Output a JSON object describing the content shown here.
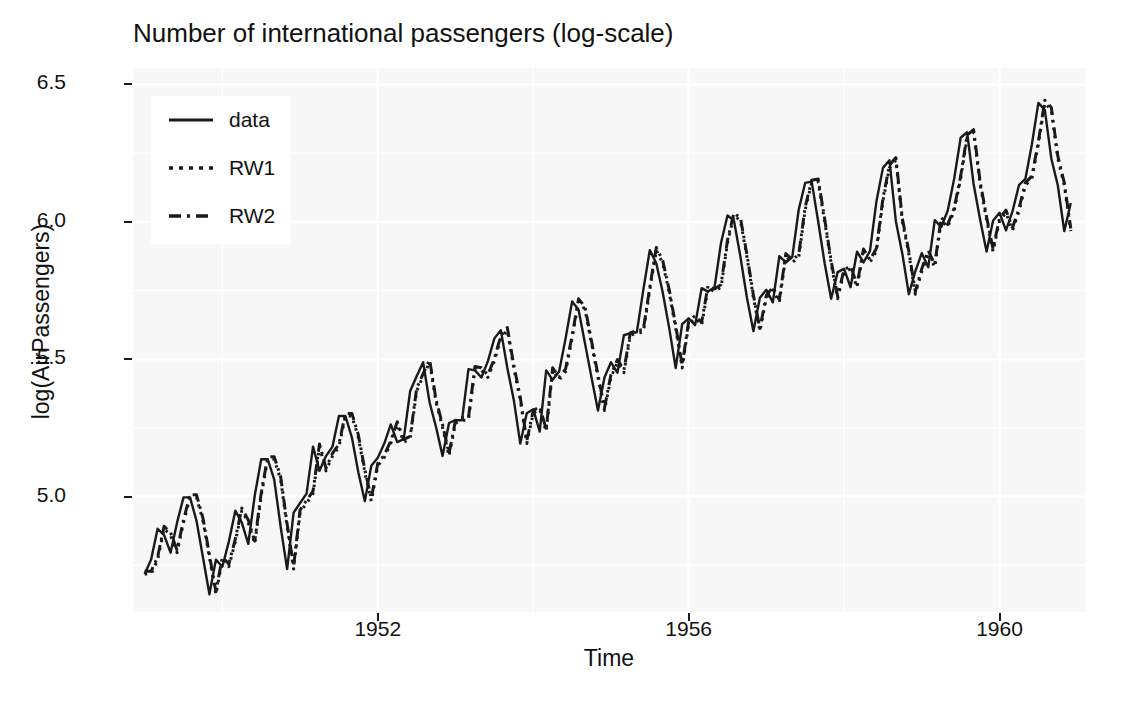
{
  "chart_data": {
    "type": "line",
    "title": "Number of international passengers (log-scale)",
    "xlabel": "Time",
    "ylabel": "log(AirPassengers)",
    "xlim": [
      1948.85,
      1961.1
    ],
    "ylim": [
      4.58,
      6.56
    ],
    "xticks": [
      1952,
      1956,
      1960
    ],
    "xtick_labels": [
      "1952",
      "1956",
      "1960"
    ],
    "yticks": [
      5.0,
      5.5,
      6.0,
      6.5
    ],
    "ytick_labels": [
      "5.0",
      "5.5",
      "6.0",
      "6.5"
    ],
    "grid": true,
    "grid_major_x": [
      1952,
      1956,
      1960
    ],
    "grid_major_y": [
      5.0,
      5.5,
      6.0,
      6.5
    ],
    "grid_minor_x": [
      1950,
      1954,
      1958
    ],
    "grid_minor_y": [
      4.75,
      5.25,
      5.75,
      6.25
    ],
    "legend_position": "top-left",
    "legend_entries": [
      {
        "label": "data",
        "style": "solid"
      },
      {
        "label": "RW1",
        "style": "dotted"
      },
      {
        "label": "RW2",
        "style": "dashed"
      }
    ],
    "x_start": 1949.0,
    "x_step": 0.0833333,
    "series": [
      {
        "name": "data",
        "style": "solid",
        "values": [
          4.718499,
          4.770685,
          4.882802,
          4.859812,
          4.795791,
          4.905275,
          4.997212,
          4.997212,
          4.912655,
          4.779123,
          4.644391,
          4.770685,
          4.744932,
          4.836282,
          4.94876,
          4.905275,
          4.828314,
          5.003946,
          5.135798,
          5.135798,
          5.062595,
          4.890349,
          4.736198,
          4.941642,
          4.976734,
          5.010635,
          5.181784,
          5.09375,
          5.147494,
          5.181784,
          5.293305,
          5.293305,
          5.214936,
          5.087596,
          4.983607,
          5.111988,
          5.141664,
          5.192957,
          5.26269,
          5.198497,
          5.209486,
          5.384495,
          5.438079,
          5.488938,
          5.342334,
          5.252273,
          5.147494,
          5.267858,
          5.278115,
          5.278115,
          5.463832,
          5.459586,
          5.433722,
          5.493061,
          5.575949,
          5.605802,
          5.46806,
          5.351858,
          5.192957,
          5.303305,
          5.31812,
          5.236442,
          5.459586,
          5.42495,
          5.455321,
          5.575949,
          5.710427,
          5.680173,
          5.556828,
          5.433722,
          5.313206,
          5.433722,
          5.488938,
          5.451038,
          5.587249,
          5.594711,
          5.598422,
          5.752573,
          5.897154,
          5.849325,
          5.743003,
          5.613128,
          5.46806,
          5.627621,
          5.648974,
          5.624018,
          5.758902,
          5.746203,
          5.762051,
          5.924256,
          6.023448,
          6.003887,
          5.872118,
          5.723585,
          5.602119,
          5.723585,
          5.752573,
          5.70711,
          5.874931,
          5.852202,
          5.872118,
          6.045005,
          6.142037,
          6.146329,
          6.001415,
          5.849325,
          5.720312,
          5.817111,
          5.828946,
          5.762051,
          5.891644,
          5.852202,
          5.894403,
          6.075346,
          6.196444,
          6.224558,
          6.001415,
          5.883322,
          5.736572,
          5.820083,
          5.886104,
          5.834811,
          6.006353,
          5.981414,
          6.040254,
          6.156979,
          6.306275,
          6.326149,
          6.137727,
          6.008813,
          5.891644,
          6.003887,
          6.033086,
          5.968708,
          6.037871,
          6.133398,
          6.156979,
          6.282267,
          6.43294,
          6.40688,
          6.230481,
          6.133398,
          5.966147,
          6.068426
        ]
      },
      {
        "name": "RW1",
        "style": "dotted",
        "description": "one-step-ahead random walk forecast: shifted data by one month",
        "values": [
          4.718499,
          4.718499,
          4.770685,
          4.882802,
          4.859812,
          4.795791,
          4.905275,
          4.997212,
          4.997212,
          4.912655,
          4.779123,
          4.644391,
          4.770685,
          4.744932,
          4.836282,
          4.94876,
          4.905275,
          4.828314,
          5.003946,
          5.135798,
          5.135798,
          5.062595,
          4.890349,
          4.736198,
          4.941642,
          4.976734,
          5.010635,
          5.181784,
          5.09375,
          5.147494,
          5.181784,
          5.293305,
          5.293305,
          5.214936,
          5.087596,
          4.983607,
          5.111988,
          5.141664,
          5.192957,
          5.26269,
          5.198497,
          5.209486,
          5.384495,
          5.438079,
          5.488938,
          5.342334,
          5.252273,
          5.147494,
          5.267858,
          5.278115,
          5.278115,
          5.463832,
          5.459586,
          5.433722,
          5.493061,
          5.575949,
          5.605802,
          5.46806,
          5.351858,
          5.192957,
          5.303305,
          5.31812,
          5.236442,
          5.459586,
          5.42495,
          5.455321,
          5.575949,
          5.710427,
          5.680173,
          5.556828,
          5.433722,
          5.313206,
          5.433722,
          5.488938,
          5.451038,
          5.587249,
          5.594711,
          5.598422,
          5.752573,
          5.897154,
          5.849325,
          5.743003,
          5.613128,
          5.46806,
          5.627621,
          5.648974,
          5.624018,
          5.758902,
          5.746203,
          5.762051,
          5.924256,
          6.023448,
          6.003887,
          5.872118,
          5.723585,
          5.602119,
          5.723585,
          5.752573,
          5.70711,
          5.874931,
          5.852202,
          5.872118,
          6.045005,
          6.142037,
          6.146329,
          6.001415,
          5.849325,
          5.720312,
          5.817111,
          5.828946,
          5.762051,
          5.891644,
          5.852202,
          5.894403,
          6.075346,
          6.196444,
          6.224558,
          6.001415,
          5.883322,
          5.736572,
          5.820083,
          5.886104,
          5.834811,
          6.006353,
          5.981414,
          6.040254,
          6.156979,
          6.306275,
          6.326149,
          6.137727,
          6.008813,
          5.891644,
          6.003887,
          6.033086,
          5.968708,
          6.037871,
          6.133398,
          6.156979,
          6.282267,
          6.43294,
          6.40688,
          6.230481,
          6.133398,
          5.966147
        ]
      },
      {
        "name": "RW2",
        "style": "dashed",
        "description": "random walk with drift forecast: shifted data plus drift term",
        "values": [
          4.728,
          4.728,
          4.780185,
          4.892302,
          4.869312,
          4.805291,
          4.914775,
          5.006712,
          5.006712,
          4.922155,
          4.788623,
          4.653891,
          4.780185,
          4.754432,
          4.845782,
          4.95826,
          4.914775,
          4.837814,
          5.013446,
          5.145298,
          5.145298,
          5.072095,
          4.899849,
          4.745698,
          4.951142,
          4.986234,
          5.020135,
          5.191284,
          5.10325,
          5.156994,
          5.191284,
          5.302805,
          5.302805,
          5.224436,
          5.097096,
          4.993107,
          5.121488,
          5.151164,
          5.202457,
          5.27219,
          5.207997,
          5.218986,
          5.393995,
          5.447579,
          5.498438,
          5.351834,
          5.261773,
          5.156994,
          5.277358,
          5.287615,
          5.287615,
          5.473332,
          5.469086,
          5.443222,
          5.502561,
          5.585449,
          5.615302,
          5.47756,
          5.361358,
          5.202457,
          5.312805,
          5.32762,
          5.245942,
          5.469086,
          5.43445,
          5.464821,
          5.585449,
          5.719927,
          5.689673,
          5.566328,
          5.443222,
          5.322706,
          5.443222,
          5.498438,
          5.460538,
          5.596749,
          5.604211,
          5.607922,
          5.762073,
          5.906654,
          5.858825,
          5.752503,
          5.622628,
          5.47756,
          5.637121,
          5.658474,
          5.633518,
          5.768402,
          5.755703,
          5.771551,
          5.933756,
          6.032948,
          6.013387,
          5.881618,
          5.733085,
          5.611619,
          5.733085,
          5.762073,
          5.71661,
          5.884431,
          5.861702,
          5.881618,
          6.054505,
          6.151537,
          6.155829,
          6.010915,
          5.858825,
          5.729812,
          5.826611,
          5.838446,
          5.771551,
          5.901144,
          5.861702,
          5.903903,
          6.084846,
          6.205944,
          6.234058,
          6.010915,
          5.892822,
          5.746072,
          5.829583,
          5.895604,
          5.844311,
          6.015853,
          5.990914,
          6.049754,
          6.166479,
          6.315775,
          6.335649,
          6.147227,
          6.018313,
          5.901144,
          6.013387,
          6.042586,
          5.978208,
          6.047371,
          6.142898,
          6.166479,
          6.291767,
          6.44244,
          6.41638,
          6.239981,
          6.142898,
          5.975647
        ]
      }
    ]
  },
  "style": {
    "panel_background": "#f7f7f7",
    "gridline_color": "#ffffff",
    "line_color": "#1a1a1a",
    "text_color": "#111111",
    "legend_background": "#ffffff"
  }
}
